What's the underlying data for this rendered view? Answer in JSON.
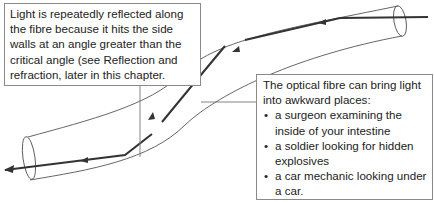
{
  "diagram": {
    "type": "optical-fibre-total-internal-reflection",
    "left_callout": {
      "text": "Light is repeatedly reflected along the fibre because it hits the side walls at an angle greater than the critical angle (see Reflection and refraction, later in this chapter."
    },
    "right_callout": {
      "intro": "The optical fibre can bring light into awkward places:",
      "items": [
        "a surgeon examining the inside of your intestine",
        "a soldier looking for hidden explosives",
        "a car mechanic looking under a car."
      ]
    },
    "colors": {
      "ray": "#333333",
      "fibre_outline": "#555555",
      "box_border": "#8a8a8a",
      "leader_line": "#777777"
    }
  }
}
